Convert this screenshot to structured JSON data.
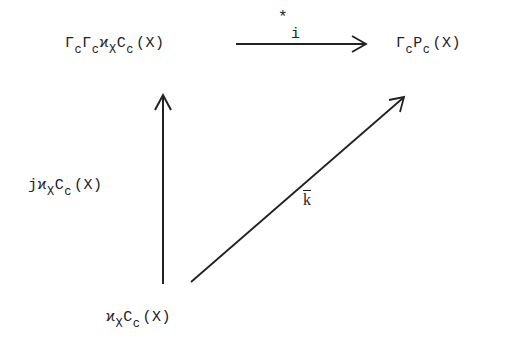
{
  "diagram": {
    "type": "commutative-diagram",
    "nodes": {
      "top_left": {
        "parts": [
          {
            "base": "Γ",
            "sub": "c"
          },
          {
            "base": "Γ",
            "sub": "c"
          },
          {
            "base": "ϰ",
            "sub": "X"
          },
          {
            "base": "C",
            "sub": "c"
          },
          {
            "base": "(X)",
            "sub": ""
          }
        ],
        "plain": "Γ_c Γ_c ϰ_X C_c (X)"
      },
      "top_right": {
        "parts": [
          {
            "base": "Γ",
            "sub": "c"
          },
          {
            "base": "P",
            "sub": "c"
          },
          {
            "base": "(X)",
            "sub": ""
          }
        ],
        "plain": "Γ_c P_c (X)"
      },
      "bottom": {
        "parts": [
          {
            "base": "ϰ",
            "sub": "X"
          },
          {
            "base": "C",
            "sub": "c"
          },
          {
            "base": "(X)",
            "sub": ""
          }
        ],
        "plain": "ϰ_X C_c (X)"
      }
    },
    "arrows": {
      "horizontal": {
        "from": "top_left",
        "to": "top_right",
        "label_sup": "*",
        "label": "i"
      },
      "vertical": {
        "from": "bottom",
        "to": "top_left",
        "label_parts": [
          {
            "base": "j",
            "sub": ""
          },
          {
            "base": "ϰ",
            "sub": "X"
          },
          {
            "base": "C",
            "sub": "c"
          },
          {
            "base": "(X)",
            "sub": ""
          }
        ],
        "label_plain": "j ϰ_X C_c (X)"
      },
      "diagonal": {
        "from": "bottom",
        "to": "top_right",
        "label": "k"
      }
    },
    "colors": {
      "ink": "#222222",
      "background": "#ffffff"
    }
  }
}
